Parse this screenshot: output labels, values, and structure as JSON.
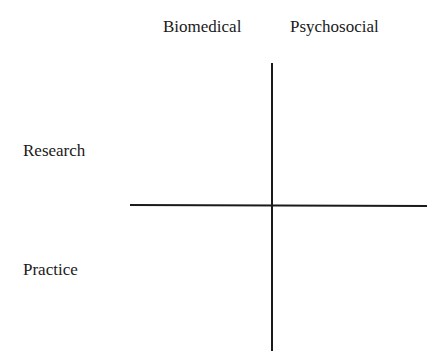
{
  "diagram": {
    "type": "2x2 quadrant matrix",
    "columns": [
      "Biomedical",
      "Psychosocial"
    ],
    "rows": [
      "Research",
      "Practice"
    ],
    "line_color": "#1a1a1a"
  }
}
